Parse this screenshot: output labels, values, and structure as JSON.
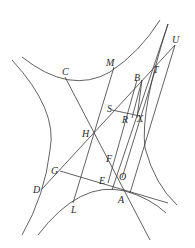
{
  "diagram": {
    "type": "geometric-construction",
    "labels": {
      "A": "A",
      "B": "B",
      "C": "C",
      "D": "D",
      "E": "E",
      "F": "F",
      "G": "G",
      "H": "H",
      "L": "L",
      "M": "M",
      "O": "O",
      "R": "R",
      "S": "S",
      "T": "T",
      "U": "U",
      "X": "X"
    },
    "points": {
      "A": [
        125,
        191
      ],
      "B": [
        142,
        80
      ],
      "C": [
        65,
        77
      ],
      "D": [
        42,
        189
      ],
      "E": [
        108,
        183
      ],
      "F": [
        110,
        163
      ],
      "G": [
        60,
        171
      ],
      "H": [
        95,
        133
      ],
      "L": [
        73,
        203
      ],
      "M": [
        114,
        67
      ],
      "O": [
        124,
        174
      ],
      "R": [
        132,
        118
      ],
      "S": [
        112,
        110
      ],
      "T": [
        155,
        71
      ],
      "U": [
        175,
        45
      ],
      "X": [
        137,
        115
      ]
    },
    "colors": {
      "stroke": "#3a3a3a",
      "text": "#2a2a2a",
      "background": "#ffffff"
    }
  }
}
